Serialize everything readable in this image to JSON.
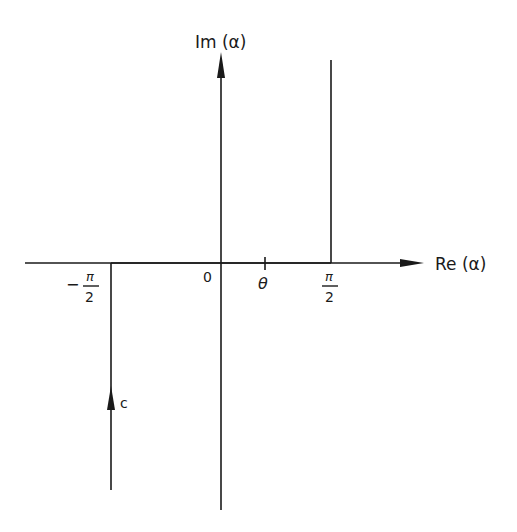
{
  "diagram": {
    "type": "complex-plane contour",
    "axes": {
      "vertical_label": "Im (α)",
      "horizontal_label": "Re (α)",
      "origin_label": "0"
    },
    "ticks": {
      "neg_half_pi": {
        "sign": "−",
        "numerator": "π",
        "denominator": "2"
      },
      "theta": "θ",
      "pos_half_pi": {
        "numerator": "π",
        "denominator": "2"
      }
    },
    "contour": {
      "label": "c",
      "segments": [
        "vertical line at Re(α) = −π/2 from −i∞ up to real axis (arrow upward)",
        "along real axis from −π/2 to π/2",
        "vertical line at Re(α) = π/2 from real axis up to +i∞"
      ]
    },
    "colors": {
      "ink": "#1a1a1a",
      "background": "#ffffff"
    }
  }
}
